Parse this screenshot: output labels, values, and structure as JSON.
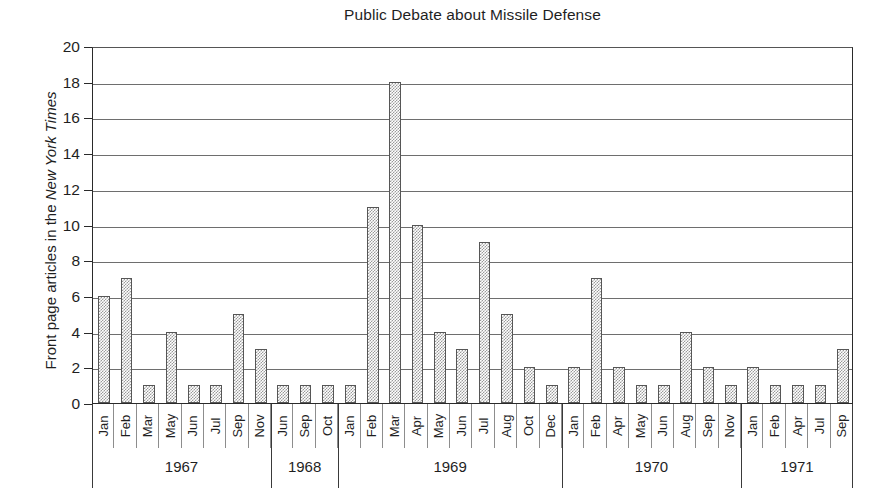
{
  "chart_data": {
    "type": "bar",
    "title": "Public Debate about Missile Defense",
    "xlabel": "",
    "ylabel": "Front page articles in the New York Times",
    "ylabel_parts": {
      "plain_prefix": "Front page articles in the ",
      "italic": "New York Times"
    },
    "ylim": [
      0,
      20
    ],
    "ytick_step": 2,
    "yticks": [
      0,
      2,
      4,
      6,
      8,
      10,
      12,
      14,
      16,
      18,
      20
    ],
    "grid": "horizontal",
    "legend": "none",
    "bar_fill": "#9a9a9a",
    "bar_pattern": "checkered-gray",
    "axis_color": "#2a2a2a",
    "categories": [
      "Jan",
      "Feb",
      "Mar",
      "May",
      "Jun",
      "Jul",
      "Sep",
      "Nov",
      "Jun",
      "Sep",
      "Oct",
      "Jan",
      "Feb",
      "Mar",
      "Apr",
      "May",
      "Jun",
      "Jul",
      "Aug",
      "Oct",
      "Dec",
      "Jan",
      "Feb",
      "Apr",
      "May",
      "Jun",
      "Aug",
      "Sep",
      "Nov",
      "Jan",
      "Feb",
      "Apr",
      "Jul",
      "Sep"
    ],
    "values": [
      6,
      7,
      1,
      4,
      1,
      1,
      5,
      3,
      1,
      1,
      1,
      1,
      11,
      18,
      10,
      4,
      3,
      9,
      5,
      2,
      1,
      2,
      7,
      2,
      1,
      1,
      4,
      2,
      1,
      2,
      1,
      1,
      1,
      3
    ],
    "year_groups": [
      {
        "year": "1967",
        "months": [
          "Jan",
          "Feb",
          "Mar",
          "May",
          "Jun",
          "Jul",
          "Sep",
          "Nov"
        ],
        "values": [
          6,
          7,
          1,
          4,
          1,
          1,
          5,
          3
        ]
      },
      {
        "year": "1968",
        "months": [
          "Jun",
          "Sep",
          "Oct"
        ],
        "values": [
          1,
          1,
          1
        ]
      },
      {
        "year": "1969",
        "months": [
          "Jan",
          "Feb",
          "Mar",
          "Apr",
          "May",
          "Jun",
          "Jul",
          "Aug",
          "Oct",
          "Dec"
        ],
        "values": [
          1,
          11,
          18,
          10,
          4,
          3,
          9,
          5,
          2,
          1
        ]
      },
      {
        "year": "1970",
        "months": [
          "Jan",
          "Feb",
          "Apr",
          "May",
          "Jun",
          "Aug",
          "Sep",
          "Nov"
        ],
        "values": [
          2,
          7,
          2,
          1,
          1,
          4,
          2,
          1
        ]
      },
      {
        "year": "1971",
        "months": [
          "Jan",
          "Feb",
          "Apr",
          "Jul",
          "Sep"
        ],
        "values": [
          2,
          1,
          1,
          1,
          3
        ]
      }
    ]
  }
}
